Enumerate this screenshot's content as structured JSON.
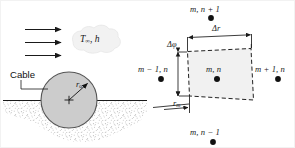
{
  "figure": {
    "width": 295,
    "height": 148,
    "background_color": "#ffffff"
  },
  "colors": {
    "line": "#1a1a1a",
    "cable_fill": "#cccccc",
    "cable_stroke": "#4d4d4d",
    "soil_fill": "#ffffff",
    "soil_stipple": "#7a7a7a",
    "cell_fill": "#f0f0f0",
    "cell_dash": "#222222",
    "cloud_fill": "#f2f2f2",
    "cloud_stroke": "#e0e0e0",
    "node_dot": "#111111",
    "text": "#1a1a1a"
  },
  "left_panel": {
    "name": "buried-cable-schematic",
    "flow_arrows": {
      "name": "free-stream-flow-arrows",
      "count": 3,
      "direction": "right"
    },
    "fluid_label": {
      "symbol_temperature": "T",
      "subscript_temperature": "∞",
      "separator": ", ",
      "symbol_coefficient": "h",
      "plain": "T∞, h"
    },
    "cable_label": "Cable",
    "radius_label": {
      "symbol": "r",
      "subscript": "o",
      "plain": "ro"
    },
    "ground_line_label": "ground surface",
    "soil_label": "soil"
  },
  "right_panel": {
    "name": "polar-grid-control-volume",
    "nodes": [
      {
        "id": "node-top",
        "label_math": "m, n + 1",
        "position": "top"
      },
      {
        "id": "node-left",
        "label_math": "m − 1, n",
        "position": "left"
      },
      {
        "id": "node-center",
        "label_math": "m, n",
        "position": "center"
      },
      {
        "id": "node-right",
        "label_math": "m + 1, n",
        "position": "right"
      },
      {
        "id": "node-bottom",
        "label_math": "m, n − 1",
        "position": "bottom"
      }
    ],
    "dimensions": [
      {
        "id": "delta-r",
        "label_math": "Δr",
        "orientation": "horizontal",
        "description": "radial grid spacing across the control volume"
      },
      {
        "id": "delta-phi",
        "label_math": "Δφ",
        "orientation": "vertical",
        "description": "angular grid spacing across the control volume"
      },
      {
        "id": "r-m",
        "label_symbol": "r",
        "label_subscript": "m",
        "label_math": "rm",
        "orientation": "horizontal",
        "description": "radial coordinate of node m"
      }
    ],
    "control_volume": {
      "name": "dashed-control-volume",
      "stroke_style": "dashed",
      "shape": "quadrilateral"
    }
  }
}
